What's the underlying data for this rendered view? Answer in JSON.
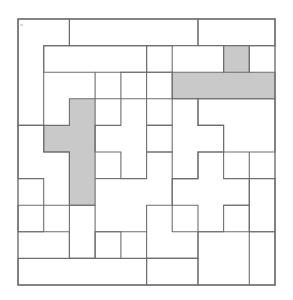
{
  "figure": {
    "kind": "polyomino-tiling-puzzle",
    "title": "",
    "caption": "",
    "background_color": "#ffffff",
    "line_color": "#6e6e6e",
    "plain_piece_color": "#ffffff",
    "shaded_piece_color": "#c9c9c9"
  },
  "board": {
    "name": "board",
    "columns": 10,
    "rows": 10,
    "origin_x": 18,
    "origin_y": 19,
    "cell_width": 25.7,
    "cell_height": 26.6,
    "frame_label": "board-outline"
  },
  "legend": {
    "shaded_meaning": "highlighted pieces",
    "plain_meaning": "ordinary pieces"
  },
  "counts": {
    "total_pieces": 20,
    "shaded_pieces": 2,
    "plain_pieces": 18,
    "cells_per_piece": 5
  },
  "pieces": [
    {
      "id": "p01",
      "name": "piece-top-left-L",
      "shaded": false,
      "cells": [
        [
          0,
          0
        ],
        [
          1,
          0
        ],
        [
          0,
          1
        ],
        [
          0,
          2
        ],
        [
          0,
          3
        ]
      ],
      "label": ""
    },
    {
      "id": "p02",
      "name": "piece-top-bar",
      "shaded": false,
      "cells": [
        [
          2,
          0
        ],
        [
          3,
          0
        ],
        [
          4,
          0
        ],
        [
          5,
          0
        ],
        [
          6,
          0
        ]
      ],
      "label": ""
    },
    {
      "id": "p03",
      "name": "piece-top-right-corner",
      "shaded": false,
      "cells": [
        [
          7,
          0
        ],
        [
          8,
          0
        ],
        [
          9,
          0
        ],
        [
          9,
          1
        ],
        [
          8,
          1
        ]
      ],
      "label": ""
    },
    {
      "id": "p04",
      "name": "piece-upper-T-left",
      "shaded": false,
      "cells": [
        [
          2,
          1
        ],
        [
          3,
          1
        ],
        [
          4,
          1
        ],
        [
          5,
          1
        ],
        [
          3,
          2
        ]
      ],
      "label": ""
    },
    {
      "id": "p05",
      "name": "piece-upper-S-center",
      "shaded": false,
      "cells": [
        [
          4,
          2
        ],
        [
          5,
          2
        ],
        [
          5,
          1
        ],
        [
          6,
          1
        ],
        [
          6,
          2
        ]
      ],
      "label": ""
    },
    {
      "id": "p06",
      "name": "piece-left-notch",
      "shaded": false,
      "cells": [
        [
          1,
          1
        ],
        [
          1,
          2
        ],
        [
          1,
          3
        ],
        [
          2,
          3
        ],
        [
          0,
          4
        ]
      ],
      "label": ""
    },
    {
      "id": "p07",
      "name": "piece-shaded-top-right-T",
      "shaded": true,
      "cells": [
        [
          8,
          1
        ],
        [
          6,
          2
        ],
        [
          7,
          2
        ],
        [
          8,
          2
        ],
        [
          9,
          2
        ]
      ],
      "label": "shaded-piece-a"
    },
    {
      "id": "p08",
      "name": "piece-shaded-left-T",
      "shaded": true,
      "cells": [
        [
          2,
          3
        ],
        [
          2,
          4
        ],
        [
          1,
          4
        ],
        [
          2,
          5
        ],
        [
          2,
          6
        ]
      ],
      "label": "shaded-piece-b"
    },
    {
      "id": "p09",
      "name": "piece-left-mid-block",
      "shaded": false,
      "cells": [
        [
          0,
          4
        ],
        [
          0,
          5
        ],
        [
          1,
          5
        ],
        [
          0,
          6
        ],
        [
          1,
          6
        ]
      ],
      "label": ""
    },
    {
      "id": "p10",
      "name": "piece-center-plus",
      "shaded": false,
      "cells": [
        [
          5,
          3
        ],
        [
          4,
          4
        ],
        [
          5,
          4
        ],
        [
          6,
          4
        ],
        [
          5,
          5
        ]
      ],
      "label": ""
    },
    {
      "id": "p11",
      "name": "piece-center-left-Z",
      "shaded": false,
      "cells": [
        [
          3,
          4
        ],
        [
          4,
          4
        ],
        [
          3,
          5
        ],
        [
          3,
          6
        ],
        [
          4,
          6
        ]
      ],
      "label": ""
    },
    {
      "id": "p12",
      "name": "piece-right-mid-bar",
      "shaded": false,
      "cells": [
        [
          7,
          3
        ],
        [
          8,
          3
        ],
        [
          9,
          3
        ],
        [
          7,
          4
        ],
        [
          8,
          4
        ]
      ],
      "label": ""
    },
    {
      "id": "p13",
      "name": "piece-right-cross",
      "shaded": false,
      "cells": [
        [
          7,
          5
        ],
        [
          6,
          6
        ],
        [
          7,
          6
        ],
        [
          8,
          6
        ],
        [
          7,
          7
        ]
      ],
      "label": ""
    },
    {
      "id": "p14",
      "name": "piece-right-edge-block",
      "shaded": false,
      "cells": [
        [
          9,
          4
        ],
        [
          9,
          5
        ],
        [
          9,
          6
        ],
        [
          8,
          5
        ],
        [
          9,
          7
        ]
      ],
      "label": ""
    },
    {
      "id": "p15",
      "name": "piece-lower-left-stair",
      "shaded": false,
      "cells": [
        [
          0,
          7
        ],
        [
          1,
          7
        ],
        [
          0,
          8
        ],
        [
          1,
          8
        ],
        [
          2,
          8
        ]
      ],
      "label": ""
    },
    {
      "id": "p16",
      "name": "piece-lower-center-S",
      "shaded": false,
      "cells": [
        [
          3,
          7
        ],
        [
          4,
          7
        ],
        [
          5,
          7
        ],
        [
          5,
          8
        ],
        [
          6,
          8
        ]
      ],
      "label": ""
    },
    {
      "id": "p17",
      "name": "piece-bottom-left-bar",
      "shaded": false,
      "cells": [
        [
          0,
          9
        ],
        [
          1,
          9
        ],
        [
          2,
          9
        ],
        [
          3,
          9
        ],
        [
          2,
          7
        ]
      ],
      "label": ""
    },
    {
      "id": "p18",
      "name": "piece-bottom-center-block",
      "shaded": false,
      "cells": [
        [
          4,
          9
        ],
        [
          5,
          9
        ],
        [
          6,
          9
        ],
        [
          4,
          8
        ],
        [
          3,
          8
        ]
      ],
      "label": ""
    },
    {
      "id": "p19",
      "name": "piece-bottom-right-square",
      "shaded": false,
      "cells": [
        [
          7,
          8
        ],
        [
          8,
          8
        ],
        [
          9,
          8
        ],
        [
          7,
          9
        ],
        [
          8,
          9
        ]
      ],
      "label": ""
    },
    {
      "id": "p20",
      "name": "piece-right-lower-L",
      "shaded": false,
      "cells": [
        [
          8,
          7
        ],
        [
          9,
          7
        ],
        [
          6,
          7
        ],
        [
          9,
          9
        ],
        [
          6,
          5
        ]
      ],
      "label": ""
    }
  ],
  "outlines": {
    "note": "path data for drawn region boundaries",
    "frame": "M18,19 L275,19 L275,285 L18,285 Z"
  }
}
